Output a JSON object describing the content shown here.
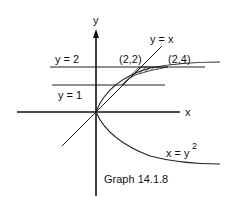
{
  "figure": {
    "caption": "Graph 14.1.8",
    "axes": {
      "x_label": "x",
      "y_label": "y"
    },
    "lines": [
      {
        "label": "y = 2",
        "equation": "y = 2"
      },
      {
        "label": "y = 1",
        "equation": "y = 1"
      },
      {
        "label": "y = x",
        "equation": "y = x"
      }
    ],
    "curve": {
      "label_base": "x = y",
      "label_exp": "2",
      "equation": "x = y^2"
    },
    "points": [
      {
        "label": "(2,2)"
      },
      {
        "label": "(2,4)"
      }
    ],
    "shaded_region": "region between y = x and x = y^2 for 1 <= y <= 2"
  },
  "colors": {
    "ink": "#111111",
    "background": "#ffffff"
  }
}
